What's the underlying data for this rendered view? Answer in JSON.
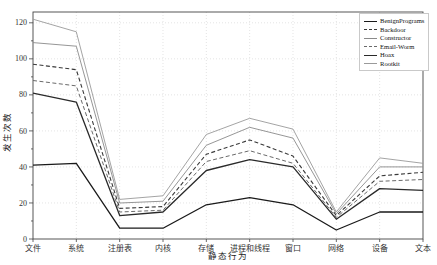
{
  "chart_data": {
    "type": "line",
    "title": "",
    "xlabel": "静态行为",
    "ylabel": "发生次数",
    "categories": [
      "文件",
      "系统",
      "注册表",
      "内核",
      "存储",
      "进程和线程",
      "窗口",
      "网络",
      "设备",
      "文本"
    ],
    "ylim": [
      0,
      126
    ],
    "yticks": [
      0,
      20,
      40,
      60,
      80,
      100,
      120
    ],
    "y_minor_step": 10,
    "grid": "dotted",
    "legend_position": "top-right",
    "series": [
      {
        "name": "BenignPrograms",
        "style": "solid",
        "width": 1.3,
        "color": "#1a1a1a",
        "values": [
          41,
          42,
          6,
          6,
          19,
          23,
          19,
          5,
          15,
          15
        ]
      },
      {
        "name": "Backdoor",
        "style": "dashed",
        "width": 1.1,
        "color": "#3a3a3a",
        "values": [
          97,
          94,
          17,
          18,
          47,
          55,
          46,
          13,
          35,
          37
        ]
      },
      {
        "name": "Constructor",
        "style": "solid",
        "width": 0.9,
        "color": "#8a8a8a",
        "values": [
          109,
          107,
          20,
          21,
          52,
          62,
          56,
          14,
          40,
          40
        ]
      },
      {
        "name": "Email-Worm",
        "style": "dashed",
        "width": 1.0,
        "color": "#6a6a6a",
        "values": [
          88,
          85,
          15,
          16,
          43,
          49,
          42,
          12,
          32,
          33
        ]
      },
      {
        "name": "Hoax",
        "style": "solid",
        "width": 1.3,
        "color": "#2a2a2a",
        "values": [
          81,
          76,
          13,
          15,
          38,
          44,
          40,
          11,
          28,
          27
        ]
      },
      {
        "name": "Rootkit",
        "style": "solid",
        "width": 0.9,
        "color": "#9a9a9a",
        "values": [
          122,
          115,
          22,
          24,
          58,
          67,
          61,
          15,
          45,
          42
        ]
      }
    ],
    "axis_color": "#444444",
    "grid_color": "#d9d9d9",
    "tick_label_color": "#333333"
  }
}
